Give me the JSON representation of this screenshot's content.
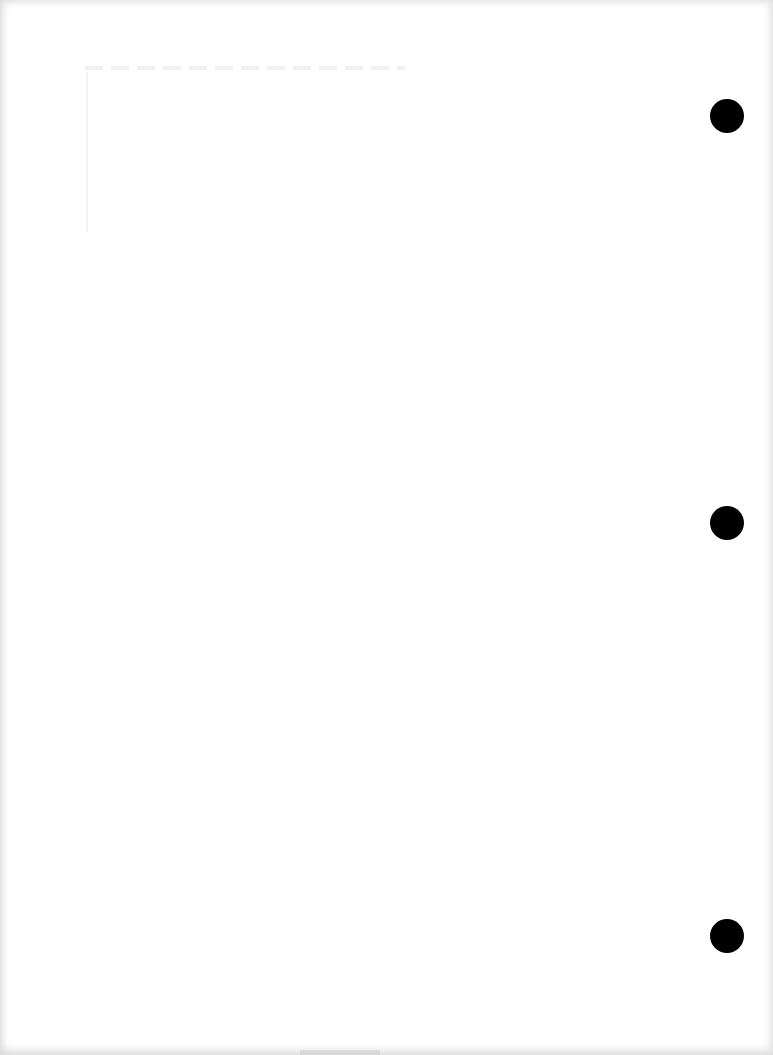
{
  "document": {
    "type": "blank scanned page",
    "text_content": "",
    "punch_holes": [
      {
        "position": "top-right",
        "x": 727,
        "y": 116
      },
      {
        "position": "middle-right",
        "x": 727,
        "y": 523
      },
      {
        "position": "bottom-right",
        "x": 727,
        "y": 936
      }
    ],
    "colors": {
      "paper": "#ffffff",
      "hole": "#000000",
      "edge_shadow": "#d8d8d8"
    }
  }
}
